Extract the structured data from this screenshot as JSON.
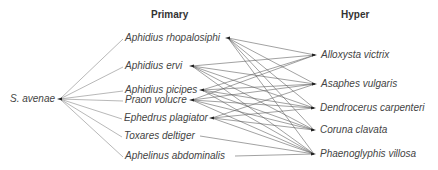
{
  "headers": {
    "primary": "Primary",
    "hyper": "Hyper"
  },
  "host": {
    "name": "S. avenae",
    "x": 60,
    "y": 99,
    "label_x": 10,
    "label_y": 93
  },
  "primary": [
    {
      "name": "Aphidius rhopalosiphi",
      "label_x": 125,
      "y": 38,
      "out_x": 228
    },
    {
      "name": "Aphidius ervi",
      "label_x": 125,
      "y": 66,
      "out_x": 192
    },
    {
      "name": "Aphidius picipes",
      "label_x": 125,
      "y": 90,
      "out_x": 202
    },
    {
      "name": "Praon volucre",
      "label_x": 125,
      "y": 100,
      "out_x": 192
    },
    {
      "name": "Ephedrus plagiator",
      "label_x": 124,
      "y": 118,
      "out_x": 212
    },
    {
      "name": "Toxares deltiger",
      "label_x": 124,
      "y": 136,
      "out_x": 200
    },
    {
      "name": "Aphelinus abdominalis",
      "label_x": 125,
      "y": 156,
      "out_x": 235
    }
  ],
  "hyper": [
    {
      "name": "Alloxysta victrix",
      "label_x": 321,
      "y": 55,
      "in_x": 315
    },
    {
      "name": "Asaphes vulgaris",
      "label_x": 321,
      "y": 84,
      "in_x": 315
    },
    {
      "name": "Dendrocerus carpenteri",
      "label_x": 320,
      "y": 108,
      "in_x": 314
    },
    {
      "name": "Coruna clavata",
      "label_x": 320,
      "y": 130,
      "in_x": 314
    },
    {
      "name": "Phaenoglyphis villosa",
      "label_x": 320,
      "y": 154,
      "in_x": 314
    }
  ],
  "host_edges": [
    0,
    1,
    2,
    3,
    4,
    5,
    6
  ],
  "hyper_edges": [
    [
      0,
      0
    ],
    [
      0,
      1
    ],
    [
      0,
      2
    ],
    [
      0,
      3
    ],
    [
      0,
      4
    ],
    [
      1,
      0
    ],
    [
      1,
      1
    ],
    [
      1,
      2
    ],
    [
      1,
      3
    ],
    [
      1,
      4
    ],
    [
      2,
      0
    ],
    [
      2,
      1
    ],
    [
      2,
      2
    ],
    [
      2,
      3
    ],
    [
      2,
      4
    ],
    [
      3,
      0
    ],
    [
      3,
      1
    ],
    [
      3,
      2
    ],
    [
      3,
      3
    ],
    [
      3,
      4
    ],
    [
      4,
      1
    ],
    [
      4,
      2
    ],
    [
      4,
      3
    ],
    [
      4,
      4
    ],
    [
      5,
      4
    ],
    [
      6,
      4
    ]
  ],
  "colors": {
    "host_edge": "#9a9a9a",
    "hyper_edge": "#555555",
    "text": "#444444"
  },
  "chart_data": {
    "type": "network",
    "title": "",
    "columns": [
      "Host",
      "Primary",
      "Hyper"
    ],
    "nodes": {
      "host": [
        "S. avenae"
      ],
      "primary": [
        "Aphidius rhopalosiphi",
        "Aphidius ervi",
        "Aphidius picipes",
        "Praon volucre",
        "Ephedrus plagiator",
        "Toxares deltiger",
        "Aphelinus abdominalis"
      ],
      "hyper": [
        "Alloxysta victrix",
        "Asaphes vulgaris",
        "Dendrocerus carpenteri",
        "Coruna clavata",
        "Phaenoglyphis villosa"
      ]
    }
  }
}
